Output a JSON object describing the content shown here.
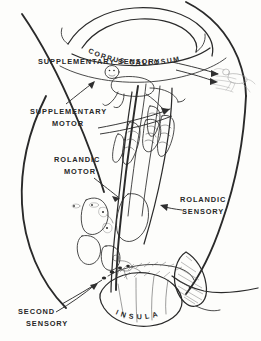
{
  "figure": {
    "background_color": "#fdfdfb",
    "ink_color": "#2a2a2a",
    "width": 261,
    "height": 341
  },
  "labels": {
    "corpus_callosum": "CORPUS CALLOSUM",
    "supplementary_sensory": "SUPPLEMENTARY SENSORY",
    "supplementary_motor_line1": "SUPPLEMENTARY",
    "supplementary_motor_line2": "MOTOR",
    "rolandic_motor_line1": "ROLANDIC",
    "rolandic_motor_line2": "MOTOR",
    "rolandic_sensory_line1": "ROLANDIC",
    "rolandic_sensory_line2": "SENSORY",
    "second_sensory_line1": "SECOND",
    "second_sensory_line2": "SENSORY",
    "insula": "INSULA",
    "insula_letters": [
      "I",
      "N",
      "S",
      "U",
      "L",
      "A"
    ]
  },
  "regions": [
    {
      "name": "corpus-callosum",
      "label": "CORPUS CALLOSUM"
    },
    {
      "name": "supplementary-sensory-area",
      "label": "SUPPLEMENTARY SENSORY"
    },
    {
      "name": "supplementary-motor-area",
      "label": "SUPPLEMENTARY MOTOR"
    },
    {
      "name": "rolandic-motor-area",
      "label": "ROLANDIC MOTOR"
    },
    {
      "name": "rolandic-sensory-area",
      "label": "ROLANDIC SENSORY"
    },
    {
      "name": "second-sensory-area",
      "label": "SECOND SENSORY"
    },
    {
      "name": "insula-region",
      "label": "INSULA"
    }
  ],
  "icons": {
    "homunculus_supplementary": "homunculus-figure-icon",
    "homunculus_right_faint": "homunculus-figure-faint-icon",
    "hand_digits_motor": "hand-digits-icon",
    "hand_digits_sensory": "hand-digits-icon",
    "arrow_supplementary_sensory": "arrow-right-icon",
    "arrow_supplementary_motor": "arrow-right-icon",
    "arrow_rolandic_motor": "arrow-down-right-icon",
    "arrow_rolandic_sensory": "arrow-left-icon",
    "arrow_second_sensory": "arrow-up-right-icon"
  }
}
